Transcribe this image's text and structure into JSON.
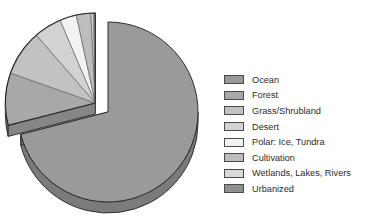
{
  "chart_data": {
    "type": "pie",
    "title": "",
    "subtitle": "",
    "xlabel": "",
    "ylabel": "",
    "grid": false,
    "legend_position": "right",
    "exploded_group": [
      "Forest",
      "Grass/Shrubland",
      "Desert",
      "Polar: Ice, Tundra",
      "Cultivation",
      "Wetlands, Lakes, Rivers",
      "Urbanized"
    ],
    "categories": [
      "Ocean",
      "Forest",
      "Grass/Shrubland",
      "Desert",
      "Polar: Ice, Tundra",
      "Cultivation",
      "Wetlands, Lakes, Rivers",
      "Urbanized"
    ],
    "values": [
      71.0,
      9.4,
      8.2,
      5.0,
      3.0,
      2.6,
      0.5,
      0.3
    ],
    "colors": [
      "#9a9a9a",
      "#a8a8a8",
      "#c2c2c2",
      "#d2d2d2",
      "#f2f2f2",
      "#bdbdbd",
      "#d9d9d9",
      "#8f8f8f"
    ]
  },
  "legend": {
    "items": [
      {
        "label": "Ocean",
        "color": "#9a9a9a"
      },
      {
        "label": "Forest",
        "color": "#a8a8a8"
      },
      {
        "label": "Grass/Shrubland",
        "color": "#c2c2c2"
      },
      {
        "label": "Desert",
        "color": "#d2d2d2"
      },
      {
        "label": "Polar: Ice, Tundra",
        "color": "#f2f2f2"
      },
      {
        "label": "Cultivation",
        "color": "#bdbdbd"
      },
      {
        "label": "Wetlands, Lakes, Rivers",
        "color": "#d9d9d9"
      },
      {
        "label": "Urbanized",
        "color": "#8f8f8f"
      }
    ]
  }
}
